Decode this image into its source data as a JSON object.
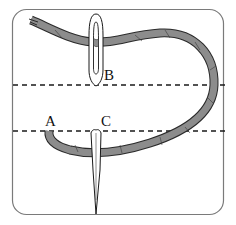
{
  "diagram": {
    "labels": {
      "a": "A",
      "b": "B",
      "c": "C"
    },
    "colors": {
      "thread_fill": "#8c8c8c",
      "thread_stroke": "#2a2a2a",
      "frame_stroke": "#7a7a7a",
      "dash_line": "#1a1a1a",
      "needle_fill": "#ffffff",
      "needle_stroke": "#1a1a1a",
      "background": "#ffffff"
    },
    "guide_lines": [
      {
        "name": "upper-guide-line",
        "y": 85
      },
      {
        "name": "lower-guide-line",
        "y": 131
      }
    ]
  }
}
